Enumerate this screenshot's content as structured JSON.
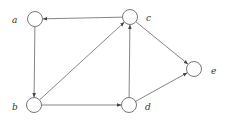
{
  "diagram": {
    "type": "directed-graph",
    "nodes": [
      {
        "id": "a",
        "label": "a",
        "x": 35,
        "y": 19,
        "lx": 12,
        "ly": 23
      },
      {
        "id": "c",
        "label": "c",
        "x": 130,
        "y": 17,
        "lx": 146,
        "ly": 21
      },
      {
        "id": "e",
        "label": "e",
        "x": 194,
        "y": 69,
        "lx": 211,
        "ly": 74
      },
      {
        "id": "b",
        "label": "b",
        "x": 34,
        "y": 105,
        "lx": 12,
        "ly": 110
      },
      {
        "id": "d",
        "label": "d",
        "x": 129,
        "y": 105,
        "lx": 145,
        "ly": 110
      }
    ],
    "edges": [
      {
        "from": "c",
        "to": "a"
      },
      {
        "from": "a",
        "to": "b"
      },
      {
        "from": "b",
        "to": "c"
      },
      {
        "from": "c",
        "to": "e"
      },
      {
        "from": "b",
        "to": "d"
      },
      {
        "from": "d",
        "to": "c"
      },
      {
        "from": "d",
        "to": "e"
      }
    ],
    "node_radius": 7.5,
    "colors": {
      "stroke": "#777777",
      "label": "#333333",
      "background": "#ffffff"
    }
  }
}
